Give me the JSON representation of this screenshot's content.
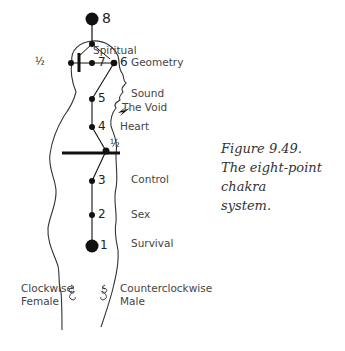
{
  "figure": {
    "caption_line1": "Figure 9.49.",
    "caption_line2": "The eight-point chakra",
    "caption_line3": "system."
  },
  "chakras": {
    "p8": {
      "number": "8"
    },
    "p7": {
      "number": "7"
    },
    "p6": {
      "number": "6",
      "label": "Geometry"
    },
    "spiritual": {
      "label": "Spiritual"
    },
    "head_half": {
      "number": "½"
    },
    "p5": {
      "number": "5",
      "label": "Sound"
    },
    "void": {
      "label": "The Void"
    },
    "p4": {
      "number": "4",
      "label": "Heart"
    },
    "diaphragm_half": {
      "number": "½"
    },
    "p3": {
      "number": "3",
      "label": "Control"
    },
    "p2": {
      "number": "2",
      "label": "Sex"
    },
    "p1": {
      "number": "1",
      "label": "Survival"
    }
  },
  "rotation": {
    "left_line1": "Clockwise",
    "left_line2": "Female",
    "right_line1": "Counterclockwise",
    "right_line2": "Male",
    "left_icon": "clockwise-spiral",
    "right_icon": "counterclockwise-spiral"
  },
  "colors": {
    "ink": "#111111",
    "outline": "#333333",
    "text": "#444444"
  }
}
